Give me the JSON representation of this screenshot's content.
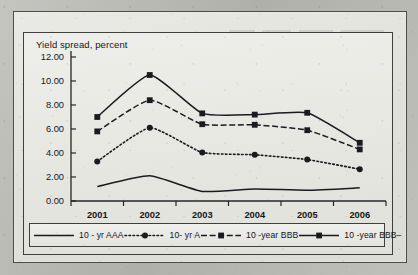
{
  "chart_data": {
    "type": "line",
    "title": "",
    "axis_note": "Yield spread, percent",
    "xlabel": "",
    "ylabel": "Yield spread, percent",
    "categories": [
      "2001",
      "2002",
      "2003",
      "2004",
      "2005",
      "2006"
    ],
    "ylim": [
      0,
      12
    ],
    "ytick_step": 2,
    "ytick_labels": [
      "12.00",
      "10.00",
      "8.00",
      "6.00",
      "4.00",
      "2.00",
      "0.00"
    ],
    "ytick_values": [
      12,
      10,
      8,
      6,
      4,
      2,
      0
    ],
    "grid": false,
    "legend_position": "bottom",
    "series": [
      {
        "name": "10 - yr AAA",
        "style": "solid",
        "marker": "none",
        "color": "#1b1b1f",
        "values": [
          1.2,
          2.1,
          0.8,
          1.0,
          0.9,
          1.1
        ]
      },
      {
        "name": "10- yr A",
        "style": "dotted",
        "marker": "circle",
        "color": "#1b1b1f",
        "values": [
          3.3,
          6.1,
          4.05,
          3.85,
          3.45,
          2.65
        ]
      },
      {
        "name": "10 -year BBB",
        "style": "dashed",
        "marker": "square",
        "color": "#1b1b1f",
        "values": [
          5.8,
          8.4,
          6.4,
          6.35,
          5.9,
          4.3
        ]
      },
      {
        "name": "10 -year BBB–",
        "style": "solid",
        "marker": "square",
        "color": "#1b1b1f",
        "values": [
          7.0,
          10.5,
          7.3,
          7.2,
          7.35,
          4.85
        ]
      }
    ]
  },
  "legend": {
    "items": [
      {
        "label": "10 - yr AAA",
        "style": "solid",
        "marker": "none"
      },
      {
        "label": "10- yr A",
        "style": "dotted",
        "marker": "circle"
      },
      {
        "label": "10 -year BBB",
        "style": "dashed",
        "marker": "square"
      },
      {
        "label": "10 -year BBB–",
        "style": "solid",
        "marker": "square"
      }
    ]
  }
}
